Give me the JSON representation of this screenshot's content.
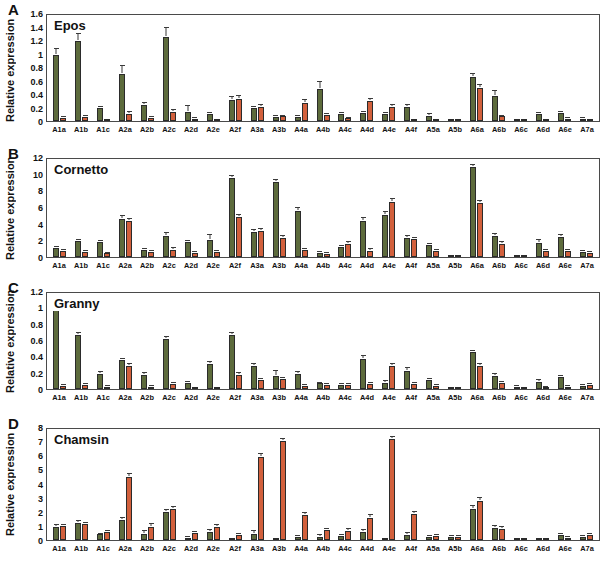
{
  "figure": {
    "ylabel": "Relative expression",
    "colors": {
      "green": "#5d6b3c",
      "red": "#d2603c",
      "axis": "#4a4a4a",
      "text": "#111111"
    },
    "categories": [
      "A1a",
      "A1b",
      "A1c",
      "A2a",
      "A2b",
      "A2c",
      "A2d",
      "A2e",
      "A2f",
      "A3a",
      "A3b",
      "A4a",
      "A4b",
      "A4c",
      "A4d",
      "A4e",
      "A4f",
      "A5a",
      "A5b",
      "A6a",
      "A6b",
      "A6c",
      "A6d",
      "A6e",
      "A7a"
    ]
  },
  "chart_data": [
    {
      "type": "bar",
      "panel": "A",
      "title": "Epos",
      "xlabel": "",
      "ylabel": "Relative expression",
      "ylim": [
        0,
        1.6
      ],
      "yticks": [
        0,
        0.2,
        0.4,
        0.6,
        0.8,
        1,
        1.2,
        1.4,
        1.6
      ],
      "ytick_labels": [
        "0",
        "0.2",
        "0.4",
        "0.6",
        "0.8",
        "1",
        "1.2",
        "1.4",
        "1.6"
      ],
      "grid": false,
      "legend": "none",
      "categories": [
        "A1a",
        "A1b",
        "A1c",
        "A2a",
        "A2b",
        "A2c",
        "A2d",
        "A2e",
        "A2f",
        "A3a",
        "A3b",
        "A4a",
        "A4b",
        "A4c",
        "A4d",
        "A4e",
        "A4f",
        "A5a",
        "A5b",
        "A6a",
        "A6b",
        "A6c",
        "A6d",
        "A6e",
        "A7a"
      ],
      "series": [
        {
          "name": "green",
          "color": "#5d6b3c",
          "values": [
            1.0,
            1.21,
            0.2,
            0.72,
            0.25,
            1.27,
            0.14,
            0.1,
            0.32,
            0.19,
            0.06,
            0.06,
            0.49,
            0.1,
            0.12,
            0.1,
            0.22,
            0.08,
            0.01,
            0.67,
            0.38,
            0.01,
            0.1,
            0.12,
            0.03
          ],
          "errors": [
            0.1,
            0.11,
            0.02,
            0.11,
            0.02,
            0.14,
            0.09,
            0.02,
            0.05,
            0.02,
            0.01,
            0.01,
            0.1,
            0.02,
            0.02,
            0.02,
            0.03,
            0.02,
            0.0,
            0.04,
            0.07,
            0.0,
            0.02,
            0.02,
            0.01
          ]
        },
        {
          "name": "red",
          "color": "#d2603c",
          "values": [
            0.05,
            0.06,
            0.02,
            0.11,
            0.05,
            0.14,
            0.03,
            0.02,
            0.34,
            0.21,
            0.07,
            0.28,
            0.09,
            0.04,
            0.31,
            0.22,
            0.01,
            0.01,
            0.01,
            0.5,
            0.07,
            0.01,
            0.02,
            0.03,
            0.02
          ],
          "errors": [
            0.01,
            0.01,
            0.0,
            0.02,
            0.01,
            0.02,
            0.01,
            0.0,
            0.04,
            0.03,
            0.01,
            0.04,
            0.02,
            0.01,
            0.03,
            0.03,
            0.0,
            0.0,
            0.0,
            0.05,
            0.01,
            0.0,
            0.0,
            0.01,
            0.0
          ]
        }
      ]
    },
    {
      "type": "bar",
      "panel": "B",
      "title": "Cornetto",
      "xlabel": "",
      "ylabel": "Relative expression",
      "ylim": [
        0,
        12
      ],
      "yticks": [
        0,
        2,
        4,
        6,
        8,
        10,
        12
      ],
      "ytick_labels": [
        "0",
        "2",
        "4",
        "6",
        "8",
        "10",
        "12"
      ],
      "grid": false,
      "legend": "none",
      "categories": [
        "A1a",
        "A1b",
        "A1c",
        "A2a",
        "A2b",
        "A2c",
        "A2d",
        "A2e",
        "A2f",
        "A3a",
        "A3b",
        "A4a",
        "A4b",
        "A4c",
        "A4d",
        "A4e",
        "A4f",
        "A5a",
        "A5b",
        "A6a",
        "A6b",
        "A6c",
        "A6d",
        "A6e",
        "A7a"
      ],
      "series": [
        {
          "name": "green",
          "color": "#5d6b3c",
          "values": [
            1.05,
            2.0,
            1.8,
            4.7,
            0.9,
            2.65,
            1.8,
            2.1,
            9.7,
            3.05,
            9.25,
            5.7,
            0.55,
            1.2,
            4.4,
            5.2,
            2.3,
            1.45,
            0.1,
            11.1,
            2.55,
            0.2,
            1.7,
            2.5,
            0.6
          ],
          "errors": [
            0.18,
            0.15,
            0.15,
            0.3,
            0.12,
            0.35,
            0.15,
            0.6,
            0.3,
            0.25,
            0.2,
            0.3,
            0.12,
            0.2,
            0.4,
            0.3,
            0.25,
            0.2,
            0.03,
            0.25,
            0.25,
            0.05,
            0.4,
            0.2,
            0.12
          ]
        },
        {
          "name": "red",
          "color": "#d2603c",
          "values": [
            0.75,
            0.65,
            0.45,
            4.4,
            0.6,
            0.9,
            0.5,
            0.6,
            4.9,
            3.15,
            2.4,
            0.9,
            0.4,
            1.55,
            0.8,
            6.75,
            2.2,
            0.8,
            0.12,
            6.7,
            1.65,
            0.25,
            0.8,
            0.7,
            0.55
          ],
          "errors": [
            0.15,
            0.1,
            0.08,
            0.25,
            0.1,
            0.18,
            0.08,
            0.1,
            0.3,
            0.25,
            0.2,
            0.15,
            0.08,
            0.25,
            0.15,
            0.35,
            0.2,
            0.12,
            0.03,
            0.2,
            0.15,
            0.05,
            0.12,
            0.12,
            0.1
          ]
        }
      ]
    },
    {
      "type": "bar",
      "panel": "C",
      "title": "Granny",
      "xlabel": "",
      "ylabel": "Relative expression",
      "ylim": [
        0,
        1.2
      ],
      "yticks": [
        0,
        0.2,
        0.4,
        0.6,
        0.8,
        1,
        1.2
      ],
      "ytick_labels": [
        "0",
        "0.2",
        "0.4",
        "0.6",
        "0.8",
        "1",
        "1.2"
      ],
      "grid": false,
      "legend": "none",
      "categories": [
        "A1a",
        "A1b",
        "A1c",
        "A2a",
        "A2b",
        "A2c",
        "A2d",
        "A2e",
        "A2f",
        "A3a",
        "A3b",
        "A4a",
        "A4b",
        "A4c",
        "A4d",
        "A4e",
        "A4f",
        "A5a",
        "A5b",
        "A6a",
        "A6b",
        "A6c",
        "A6d",
        "A6e",
        "A7a"
      ],
      "series": [
        {
          "name": "green",
          "color": "#5d6b3c",
          "values": [
            1.0,
            0.68,
            0.19,
            0.36,
            0.18,
            0.63,
            0.07,
            0.31,
            0.68,
            0.29,
            0.17,
            0.19,
            0.07,
            0.05,
            0.38,
            0.08,
            0.23,
            0.11,
            0.01,
            0.46,
            0.17,
            0.03,
            0.09,
            0.15,
            0.04
          ],
          "errors": [
            0.04,
            0.03,
            0.03,
            0.02,
            0.02,
            0.02,
            0.02,
            0.03,
            0.02,
            0.03,
            0.06,
            0.02,
            0.01,
            0.01,
            0.03,
            0.02,
            0.03,
            0.02,
            0.0,
            0.02,
            0.02,
            0.01,
            0.02,
            0.02,
            0.01
          ]
        },
        {
          "name": "red",
          "color": "#d2603c",
          "values": [
            0.04,
            0.05,
            0.03,
            0.29,
            0.03,
            0.06,
            0.02,
            0.01,
            0.18,
            0.11,
            0.12,
            0.04,
            0.05,
            0.05,
            0.06,
            0.29,
            0.06,
            0.04,
            0.01,
            0.29,
            0.08,
            0.01,
            0.02,
            0.03,
            0.05
          ],
          "errors": [
            0.01,
            0.01,
            0.01,
            0.02,
            0.01,
            0.01,
            0.0,
            0.0,
            0.02,
            0.02,
            0.02,
            0.01,
            0.01,
            0.01,
            0.01,
            0.03,
            0.01,
            0.01,
            0.0,
            0.02,
            0.01,
            0.0,
            0.01,
            0.01,
            0.01
          ]
        }
      ]
    },
    {
      "type": "bar",
      "panel": "D",
      "title": "Chamsin",
      "xlabel": "",
      "ylabel": "Relative expression",
      "ylim": [
        0,
        8
      ],
      "yticks": [
        0,
        1,
        2,
        3,
        4,
        5,
        6,
        7,
        8
      ],
      "ytick_labels": [
        "0",
        "1",
        "2",
        "3",
        "4",
        "5",
        "6",
        "7",
        "8"
      ],
      "grid": false,
      "legend": "none",
      "categories": [
        "A1a",
        "A1b",
        "A1c",
        "A2a",
        "A2b",
        "A2c",
        "A2d",
        "A2e",
        "A2f",
        "A3a",
        "A3b",
        "A4a",
        "A4b",
        "A4c",
        "A4d",
        "A4e",
        "A4f",
        "A5a",
        "A5b",
        "A6a",
        "A6b",
        "A6c",
        "A6d",
        "A6e",
        "A7a"
      ],
      "series": [
        {
          "name": "green",
          "color": "#5d6b3c",
          "values": [
            0.95,
            1.25,
            0.4,
            1.45,
            0.4,
            2.0,
            0.18,
            0.6,
            0.1,
            0.45,
            0.08,
            0.22,
            0.25,
            0.3,
            0.55,
            0.1,
            0.35,
            0.25,
            0.22,
            2.25,
            0.9,
            0.1,
            0.12,
            0.35,
            0.25
          ],
          "errors": [
            0.12,
            0.12,
            0.06,
            0.18,
            0.25,
            0.18,
            0.05,
            0.1,
            0.03,
            0.22,
            0.02,
            0.05,
            0.08,
            0.1,
            0.2,
            0.03,
            0.15,
            0.06,
            0.05,
            0.2,
            0.12,
            0.03,
            0.03,
            0.12,
            0.06
          ]
        },
        {
          "name": "red",
          "color": "#d2603c",
          "values": [
            1.0,
            1.15,
            0.55,
            4.55,
            0.95,
            2.25,
            0.5,
            0.95,
            0.35,
            6.0,
            7.2,
            1.8,
            0.7,
            0.65,
            1.6,
            7.3,
            1.85,
            0.3,
            0.22,
            2.8,
            0.8,
            0.08,
            0.1,
            0.15,
            0.35
          ],
          "errors": [
            0.12,
            0.12,
            0.08,
            0.25,
            0.18,
            0.15,
            0.08,
            0.12,
            0.08,
            0.25,
            0.1,
            0.18,
            0.12,
            0.15,
            0.18,
            0.18,
            0.2,
            0.06,
            0.05,
            0.22,
            0.12,
            0.02,
            0.03,
            0.05,
            0.08
          ]
        }
      ]
    }
  ]
}
